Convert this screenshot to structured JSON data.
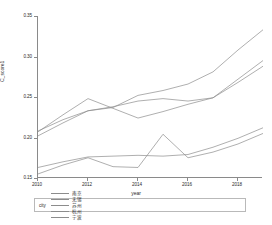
{
  "chart_data": {
    "type": "line",
    "title": "",
    "xlabel": "year",
    "ylabel": "C_score1",
    "xlim": [
      2010,
      2019
    ],
    "ylim": [
      0.15,
      0.35
    ],
    "grid": false,
    "legend_position": "bottom",
    "legend_title": "city",
    "x": [
      2010,
      2011,
      2012,
      2013,
      2014,
      2015,
      2016,
      2017,
      2018,
      2019
    ],
    "xticks": [
      2010,
      2012,
      2014,
      2016,
      2018
    ],
    "xtick_labels": [
      "2010",
      "2012",
      "2014",
      "2016",
      "2018"
    ],
    "yticks": [
      0.15,
      0.2,
      0.25,
      0.3,
      0.35
    ],
    "ytick_labels": [
      "0.15",
      "0.20",
      "0.25",
      "0.30",
      "0.35"
    ],
    "series": [
      {
        "name": "南京",
        "color": "#8c8c8c",
        "values": [
          0.208,
          0.222,
          0.233,
          0.237,
          0.252,
          0.258,
          0.266,
          0.281,
          0.308,
          0.333
        ]
      },
      {
        "name": "无锡",
        "color": "#8c8c8c",
        "values": [
          0.207,
          0.228,
          0.248,
          0.236,
          0.224,
          0.232,
          0.241,
          0.249,
          0.272,
          0.295
        ]
      },
      {
        "name": "苏州",
        "color": "#8c8c8c",
        "values": [
          0.202,
          0.218,
          0.233,
          0.238,
          0.245,
          0.248,
          0.245,
          0.249,
          0.268,
          0.288
        ]
      },
      {
        "name": "杭州",
        "color": "#8c8c8c",
        "values": [
          0.163,
          0.17,
          0.176,
          0.177,
          0.178,
          0.177,
          0.179,
          0.188,
          0.199,
          0.212
        ]
      },
      {
        "name": "宁波",
        "color": "#8c8c8c",
        "values": [
          0.155,
          0.166,
          0.175,
          0.164,
          0.163,
          0.204,
          0.175,
          0.182,
          0.192,
          0.205
        ]
      }
    ]
  }
}
